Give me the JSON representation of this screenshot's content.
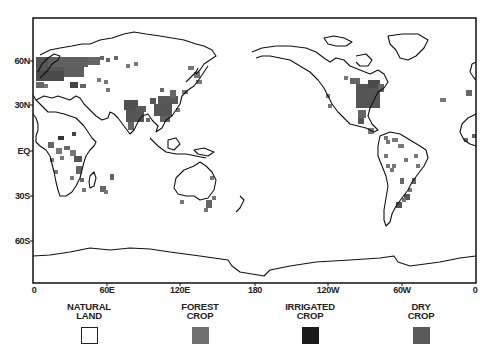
{
  "map": {
    "frame": {
      "x0": 33,
      "y0": 18,
      "x1": 476,
      "y1": 283
    },
    "y_axis": {
      "ticks": [
        {
          "label": "60N",
          "y": 61
        },
        {
          "label": "30N",
          "y": 105
        },
        {
          "label": "EQ",
          "y": 151
        },
        {
          "label": "30S",
          "y": 196
        },
        {
          "label": "60S",
          "y": 241
        }
      ]
    },
    "x_axis": {
      "ticks": [
        {
          "label": "0",
          "x": 34
        },
        {
          "label": "60E",
          "x": 107
        },
        {
          "label": "120E",
          "x": 180
        },
        {
          "label": "180",
          "x": 255
        },
        {
          "label": "120W",
          "x": 328
        },
        {
          "label": "60W",
          "x": 402
        },
        {
          "label": "0",
          "x": 475
        }
      ]
    },
    "colors": {
      "coastline": "#111111",
      "natural_land": "#ffffff",
      "forest_crop": "#6e6e6e",
      "irrigated_crop": "#1a1a1a",
      "dry_crop": "#585858"
    }
  },
  "legend": {
    "items": [
      {
        "line1": "NATURAL",
        "line2": "LAND",
        "x": 89,
        "color": "#ffffff",
        "border": "#222222"
      },
      {
        "line1": "FOREST",
        "line2": "CROP",
        "x": 200,
        "color": "#707070",
        "border": "#707070"
      },
      {
        "line1": "IRRIGATED",
        "line2": "CROP",
        "x": 310,
        "color": "#1a1a1a",
        "border": "#1a1a1a"
      },
      {
        "line1": "DRY",
        "line2": "CROP",
        "x": 421,
        "color": "#5a5a5a",
        "border": "#5a5a5a"
      }
    ]
  },
  "crop_cells": [
    [
      36,
      57,
      48,
      14,
      "#555"
    ],
    [
      48,
      57,
      40,
      10,
      "#606060"
    ],
    [
      88,
      57,
      12,
      8,
      "#666"
    ],
    [
      36,
      71,
      28,
      10,
      "#4a4a4a"
    ],
    [
      64,
      67,
      20,
      10,
      "#5e5e5e"
    ],
    [
      100,
      56,
      4,
      4,
      "#666"
    ],
    [
      106,
      58,
      4,
      4,
      "#666"
    ],
    [
      114,
      56,
      4,
      4,
      "#666"
    ],
    [
      126,
      64,
      4,
      4,
      "#777"
    ],
    [
      134,
      62,
      4,
      4,
      "#777"
    ],
    [
      36,
      82,
      8,
      6,
      "#666"
    ],
    [
      44,
      84,
      4,
      4,
      "#777"
    ],
    [
      70,
      82,
      8,
      6,
      "#444"
    ],
    [
      80,
      84,
      6,
      4,
      "#666"
    ],
    [
      97,
      78,
      4,
      4,
      "#777"
    ],
    [
      104,
      80,
      4,
      4,
      "#777"
    ],
    [
      106,
      88,
      4,
      4,
      "#777"
    ],
    [
      124,
      100,
      14,
      10,
      "#505050"
    ],
    [
      126,
      110,
      18,
      12,
      "#555"
    ],
    [
      136,
      106,
      10,
      6,
      "#5a5a5a"
    ],
    [
      128,
      122,
      6,
      8,
      "#666"
    ],
    [
      150,
      98,
      6,
      6,
      "#555"
    ],
    [
      158,
      96,
      20,
      8,
      "#585858"
    ],
    [
      154,
      104,
      18,
      12,
      "#555"
    ],
    [
      160,
      116,
      10,
      6,
      "#606060"
    ],
    [
      170,
      90,
      6,
      8,
      "#666"
    ],
    [
      188,
      66,
      6,
      4,
      "#777"
    ],
    [
      194,
      72,
      6,
      6,
      "#777"
    ],
    [
      196,
      80,
      6,
      4,
      "#777"
    ],
    [
      182,
      90,
      6,
      4,
      "#777"
    ],
    [
      160,
      88,
      4,
      4,
      "#666"
    ],
    [
      146,
      118,
      4,
      4,
      "#666"
    ],
    [
      176,
      108,
      4,
      4,
      "#777"
    ],
    [
      48,
      142,
      6,
      6,
      "#666"
    ],
    [
      56,
      148,
      6,
      6,
      "#777"
    ],
    [
      64,
      146,
      6,
      4,
      "#666"
    ],
    [
      70,
      150,
      6,
      6,
      "#777"
    ],
    [
      74,
      156,
      8,
      6,
      "#555"
    ],
    [
      50,
      158,
      4,
      4,
      "#777"
    ],
    [
      60,
      156,
      4,
      4,
      "#777"
    ],
    [
      76,
      166,
      6,
      8,
      "#666"
    ],
    [
      70,
      176,
      4,
      4,
      "#777"
    ],
    [
      80,
      178,
      4,
      4,
      "#666"
    ],
    [
      54,
      170,
      4,
      4,
      "#777"
    ],
    [
      58,
      136,
      6,
      4,
      "#333"
    ],
    [
      72,
      132,
      4,
      4,
      "#444"
    ],
    [
      110,
      174,
      4,
      6,
      "#666"
    ],
    [
      100,
      186,
      6,
      6,
      "#666"
    ],
    [
      104,
      190,
      4,
      4,
      "#777"
    ],
    [
      82,
      188,
      4,
      4,
      "#777"
    ],
    [
      180,
      200,
      4,
      4,
      "#777"
    ],
    [
      206,
      200,
      6,
      8,
      "#666"
    ],
    [
      212,
      196,
      4,
      4,
      "#777"
    ],
    [
      204,
      208,
      4,
      4,
      "#777"
    ],
    [
      210,
      176,
      4,
      4,
      "#777"
    ],
    [
      350,
      78,
      10,
      6,
      "#666"
    ],
    [
      356,
      84,
      24,
      24,
      "#555"
    ],
    [
      368,
      80,
      12,
      8,
      "#4a4a4a"
    ],
    [
      378,
      84,
      6,
      8,
      "#666"
    ],
    [
      344,
      76,
      4,
      4,
      "#777"
    ],
    [
      326,
      94,
      4,
      4,
      "#777"
    ],
    [
      328,
      104,
      4,
      4,
      "#777"
    ],
    [
      358,
      110,
      8,
      8,
      "#666"
    ],
    [
      358,
      118,
      6,
      6,
      "#555"
    ],
    [
      368,
      128,
      6,
      6,
      "#777"
    ],
    [
      384,
      136,
      4,
      4,
      "#777"
    ],
    [
      386,
      140,
      4,
      4,
      "#777"
    ],
    [
      392,
      138,
      6,
      4,
      "#777"
    ],
    [
      398,
      144,
      6,
      4,
      "#777"
    ],
    [
      384,
      154,
      4,
      4,
      "#777"
    ],
    [
      386,
      164,
      4,
      4,
      "#777"
    ],
    [
      392,
      164,
      4,
      4,
      "#777"
    ],
    [
      390,
      168,
      4,
      4,
      "#777"
    ],
    [
      404,
      158,
      4,
      4,
      "#777"
    ],
    [
      414,
      154,
      4,
      4,
      "#777"
    ],
    [
      416,
      164,
      4,
      4,
      "#777"
    ],
    [
      400,
      178,
      4,
      6,
      "#666"
    ],
    [
      412,
      178,
      4,
      6,
      "#666"
    ],
    [
      408,
      188,
      4,
      4,
      "#777"
    ],
    [
      404,
      194,
      6,
      6,
      "#555"
    ],
    [
      396,
      202,
      6,
      6,
      "#555"
    ],
    [
      402,
      198,
      4,
      4,
      "#777"
    ],
    [
      440,
      98,
      6,
      4,
      "#777"
    ],
    [
      466,
      90,
      6,
      6,
      "#666"
    ],
    [
      464,
      138,
      4,
      4,
      "#666"
    ],
    [
      472,
      134,
      4,
      4,
      "#666"
    ]
  ]
}
